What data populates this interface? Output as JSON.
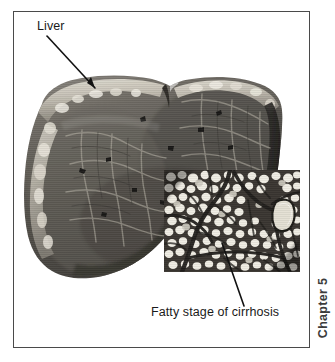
{
  "figure": {
    "type": "medical-illustration",
    "background_color": "#ffffff",
    "frame_color": "#4a4a4a"
  },
  "labels": {
    "liver": "Liver",
    "fatty_stage": "Fatty stage of cirrhosis"
  },
  "leaders": [
    {
      "name": "liver-leader",
      "from": "label Liver",
      "to": "liver capsule edge"
    },
    {
      "name": "fatty-leader",
      "from": "histology inset",
      "to": "caption"
    }
  ],
  "chapter": {
    "text": "Chapter 5",
    "orientation": "vertical-rotated-90",
    "color": "#3c3c3c"
  },
  "images": {
    "liver_specimen": {
      "name": "liver-cross-section",
      "description": "Grayscale photograph of a sectioned cirrhotic liver showing pale capsule rim and dark nodular parenchyma with fibrous septa",
      "palette": [
        "#9a968f",
        "#6e6a63",
        "#4b4843",
        "#2e2c29",
        "#d8d4cb"
      ]
    },
    "histology_inset": {
      "name": "fatty-cirrhosis-histology",
      "description": "Micrograph of fatty cirrhosis with pale lipid vacuoles separated by dark branching fibrous bands and a large pale vessel lumen",
      "palette": [
        "#f2efe8",
        "#cfcabe",
        "#55514a",
        "#1e1c1a"
      ]
    }
  }
}
